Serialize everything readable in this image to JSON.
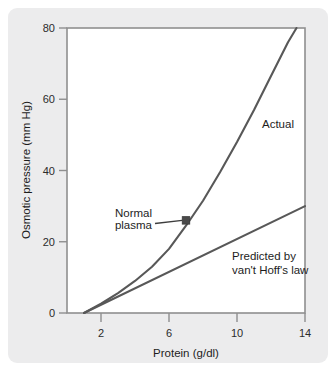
{
  "figure": {
    "panel_bg": "#ececed",
    "plot_bg": "#ffffff",
    "frame_color": "#8a8a8a",
    "line_color": "#585858",
    "marker_color": "#4a4a4a"
  },
  "chart_data": {
    "type": "line",
    "title": "",
    "xlabel": "Protein (g/dl)",
    "ylabel": "Osmotic pressure (mm Hg)",
    "xlim": [
      0,
      14
    ],
    "ylim": [
      0,
      80
    ],
    "xticks": [
      "2",
      "6",
      "10",
      "14"
    ],
    "xtick_values": [
      2,
      6,
      10,
      14
    ],
    "yticks": [
      "0",
      "20",
      "40",
      "60",
      "80"
    ],
    "ytick_values": [
      0,
      20,
      40,
      60,
      80
    ],
    "grid": false,
    "legend_position": "inline-annotations",
    "series": [
      {
        "name": "Actual",
        "label": "Actual",
        "x": [
          1.0,
          2.0,
          3.0,
          4.0,
          5.0,
          6.0,
          7.0,
          8.0,
          9.0,
          10.0,
          11.0,
          12.0,
          13.0,
          13.5
        ],
        "values": [
          0.0,
          2.6,
          5.6,
          9.0,
          13.0,
          18.0,
          24.5,
          31.5,
          39.5,
          48.0,
          57.0,
          66.5,
          76.0,
          80.0
        ]
      },
      {
        "name": "Predicted by van't Hoff's law",
        "label": "Predicted by\nvan't Hoff's law",
        "label_line1": "Predicted by",
        "label_line2": "van't Hoff's law",
        "x": [
          1.0,
          14.0
        ],
        "values": [
          0.0,
          30.0
        ]
      }
    ],
    "annotations": [
      {
        "name": "normal-plasma",
        "label_line1": "Normal",
        "label_line2": "plasma",
        "x": 7.0,
        "y": 26.0,
        "marker": "square"
      }
    ]
  }
}
